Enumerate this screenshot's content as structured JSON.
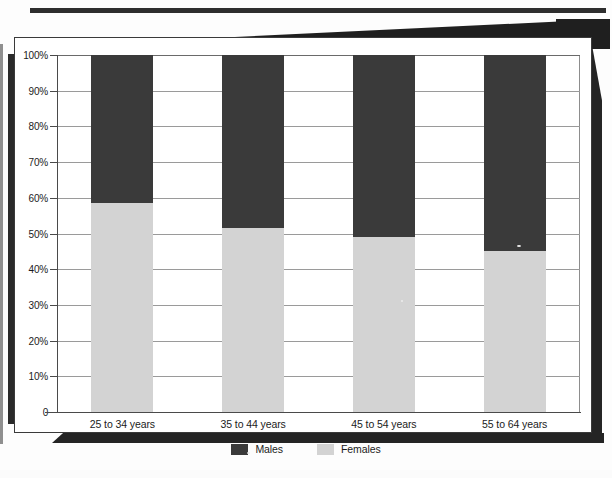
{
  "chart_data": {
    "type": "bar",
    "subtype": "100% stacked bar",
    "title": "",
    "xlabel": "",
    "ylabel": "",
    "ylim": [
      0,
      100
    ],
    "grid": true,
    "legend_position": "bottom-center",
    "categories": [
      "25 to 34 years",
      "35 to 44 years",
      "45 to 54 years",
      "55 to 64 years"
    ],
    "series": [
      {
        "name": "Males",
        "color": "#3a3a3a",
        "values": [
          41.5,
          48.5,
          51.0,
          55.0
        ]
      },
      {
        "name": "Females",
        "color": "#d3d3d3",
        "values": [
          58.5,
          51.5,
          49.0,
          45.0
        ]
      }
    ],
    "y_ticks": [
      "0",
      "10%",
      "20%",
      "30%",
      "40%",
      "50%",
      "60%",
      "70%",
      "80%",
      "90%",
      "100%"
    ],
    "y_tick_values": [
      0,
      10,
      20,
      30,
      40,
      50,
      60,
      70,
      80,
      90,
      100
    ]
  },
  "axis": {
    "y_labels": [
      "100%",
      "90%",
      "80%",
      "70%",
      "60%",
      "50%",
      "40%",
      "30%",
      "20%",
      "10%",
      "0"
    ]
  },
  "legend": {
    "items": [
      {
        "label": "Males",
        "color": "#3a3a3a"
      },
      {
        "label": "Females",
        "color": "#d3d3d3"
      }
    ]
  },
  "colors": {
    "males": "#3a3a3a",
    "females": "#d3d3d3",
    "gridline": "#9a9a9a",
    "axis": "#4a4a4a",
    "page": "#ffffff",
    "scan_shadow": "#242424"
  }
}
